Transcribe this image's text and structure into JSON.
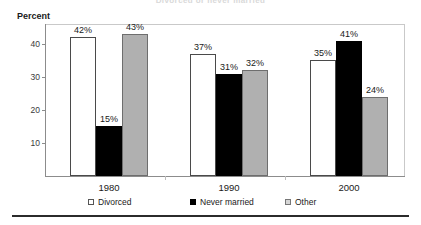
{
  "figure": {
    "title_cropped": "Divorced or never married",
    "bottom_rule": true
  },
  "chart_data": {
    "type": "bar",
    "title": "Divorced or never married",
    "xlabel": "",
    "ylabel": "Percent",
    "ylim": [
      0,
      46
    ],
    "yticks": [
      10,
      20,
      30,
      40
    ],
    "ytick_labels": [
      "10",
      "20",
      "30",
      "40"
    ],
    "grid": false,
    "legend_position": "bottom",
    "value_label_suffix": "%",
    "categories": [
      "1980",
      "1990",
      "2000"
    ],
    "series": [
      {
        "name": "Divorced",
        "color": "#ffffff",
        "edge_color": "#4a4a4a",
        "values": [
          42,
          37,
          35
        ],
        "labels": [
          "42%",
          "37%",
          "35%"
        ]
      },
      {
        "name": "Never married",
        "color": "#000000",
        "edge_color": "#000000",
        "values": [
          15,
          31,
          41
        ],
        "labels": [
          "15%",
          "31%",
          "41%"
        ]
      },
      {
        "name": "Other",
        "color": "#b0b0b0",
        "edge_color": "#6e6e6e",
        "values": [
          43,
          32,
          24
        ],
        "labels": [
          "43%",
          "32%",
          "24%"
        ]
      }
    ]
  },
  "axis": {
    "y_caption": "Percent",
    "ticks": [
      "40",
      "30",
      "20",
      "10"
    ]
  },
  "xaxis": {
    "labels": [
      "1980",
      "1990",
      "2000"
    ]
  },
  "legend": {
    "items": [
      {
        "label": "Divorced",
        "marker": "square-outline-white"
      },
      {
        "label": "Never married",
        "marker": "square-filled-black"
      },
      {
        "label": "Other",
        "marker": "square-outline-gray"
      }
    ]
  }
}
